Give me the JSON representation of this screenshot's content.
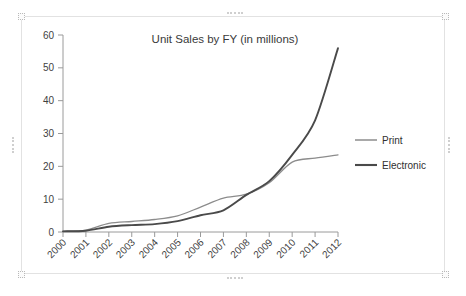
{
  "object": {
    "name": "embedded-chart-object",
    "selected": true,
    "handles": [
      "top-left",
      "top-center",
      "top-right",
      "middle-left",
      "middle-right",
      "bottom-left",
      "bottom-center",
      "bottom-right"
    ]
  },
  "colors": {
    "background": "#ffffff",
    "frame_border": "#e2e2e2",
    "axis": "#9a9a9a",
    "text": "#3a3a3a",
    "print_series": "#8c8c8c",
    "electronic_series": "#4a4a4a",
    "handle": "#cfcfcf"
  },
  "chart_data": {
    "type": "line",
    "title": "Unit Sales by FY (in millions)",
    "xlabel": "",
    "ylabel": "",
    "categories": [
      "2000",
      "2001",
      "2002",
      "2003",
      "2004",
      "2005",
      "2006",
      "2007",
      "2008",
      "2009",
      "2010",
      "2011",
      "2012"
    ],
    "x": [
      2000,
      2001,
      2002,
      2003,
      2004,
      2005,
      2006,
      2007,
      2008,
      2009,
      2010,
      2011,
      2012
    ],
    "series": [
      {
        "name": "Print",
        "color": "#8c8c8c",
        "line_width": 1.3,
        "values": [
          0.2,
          0.6,
          2.6,
          3.2,
          3.8,
          4.9,
          7.6,
          10.3,
          11.5,
          15.0,
          21.3,
          22.5,
          23.5
        ]
      },
      {
        "name": "Electronic",
        "color": "#4a4a4a",
        "line_width": 1.9,
        "values": [
          0.2,
          0.4,
          1.6,
          2.1,
          2.4,
          3.3,
          5.1,
          6.6,
          11.3,
          15.5,
          23.5,
          34.0,
          56.0
        ]
      }
    ],
    "ylim": [
      0,
      60
    ],
    "yticks": [
      0,
      10,
      20,
      30,
      40,
      50,
      60
    ],
    "ytick_labels": [
      "0",
      "10",
      "20",
      "30",
      "40",
      "50",
      "60"
    ],
    "xtick_labels": [
      "2000",
      "2001",
      "2002",
      "2003",
      "2004",
      "2005",
      "2006",
      "2007",
      "2008",
      "2009",
      "2010",
      "2011",
      "2012"
    ],
    "xtick_rotation_deg": -45,
    "grid": false,
    "legend": {
      "position": "right",
      "entries": [
        "Print",
        "Electronic"
      ]
    }
  }
}
